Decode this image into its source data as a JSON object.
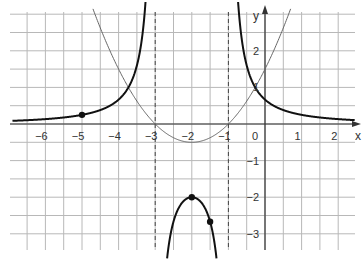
{
  "chart_data": {
    "type": "line",
    "title": "",
    "xlabel": "x",
    "ylabel": "y",
    "xlim": [
      -7.0,
      2.5
    ],
    "ylim": [
      -3.4,
      3.3
    ],
    "grid": true,
    "grid_step": 0.5,
    "x_ticks": [
      -6,
      -5,
      -4,
      -3,
      -2,
      -1,
      0,
      1,
      2
    ],
    "y_ticks": [
      -3,
      -2,
      -1,
      1,
      2
    ],
    "x_tick_labels": [
      "−6",
      "−5",
      "−4",
      "−3",
      "−2",
      "−1",
      "0",
      "1",
      "2"
    ],
    "y_tick_labels": [
      "−3",
      "−2",
      "−1",
      "1",
      "2"
    ],
    "series": [
      {
        "name": "f(x) = 0.5(x+2)² − 0.5",
        "style": "thin",
        "color": "#555555",
        "x": [
          -4.6,
          -4,
          -3.41,
          -3,
          -2.5,
          -2,
          -1.5,
          -1,
          -0.59,
          0,
          0.5
        ],
        "y": [
          2.88,
          1.5,
          0.5,
          0,
          -0.375,
          -0.5,
          -0.375,
          0,
          0.5,
          1.5,
          2.63
        ]
      },
      {
        "name": "g(x) = 1/f(x)",
        "style": "thick",
        "color": "#111111",
        "x": [
          -7,
          -6,
          -5,
          -4,
          -3.41,
          -3.2,
          -2,
          -1.5,
          0,
          1,
          2
        ],
        "y": [
          0.083,
          0.143,
          0.25,
          0.667,
          2.0,
          2.27,
          -2,
          -2.67,
          0.667,
          0.286,
          0.143
        ]
      }
    ],
    "asymptotes": [
      {
        "type": "vertical",
        "x": -3
      },
      {
        "type": "vertical",
        "x": -1
      }
    ],
    "points": [
      {
        "x": -5,
        "y": 0.25
      },
      {
        "x": -2,
        "y": -2
      },
      {
        "x": -1.5,
        "y": -2.67
      }
    ]
  }
}
